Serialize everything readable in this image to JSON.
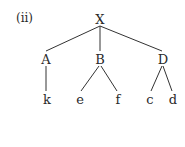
{
  "label": "(ii)",
  "tree": {
    "root": "X",
    "children": [
      {
        "label": "A",
        "children": [
          "k"
        ]
      },
      {
        "label": "B",
        "children": [
          "e",
          "f"
        ]
      },
      {
        "label": "D",
        "children": [
          "c",
          "d"
        ]
      }
    ]
  },
  "nodes": {
    "X": "X",
    "A": "A",
    "B": "B",
    "D": "D",
    "k": "k",
    "e": "e",
    "f": "f",
    "c": "c",
    "d": "d"
  }
}
